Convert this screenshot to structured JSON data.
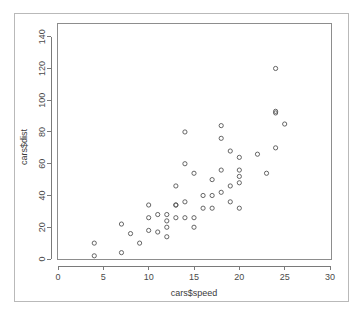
{
  "figure": {
    "background_color": "#ffffff",
    "frame_color": "#b9b9b9",
    "axis_color": "#7a7a7a",
    "point_color": "#555555"
  },
  "chart_data": {
    "type": "scatter",
    "title": "",
    "xlabel": "cars$speed",
    "ylabel": "cars$dist",
    "xlim": [
      0,
      30
    ],
    "ylim": [
      0,
      148
    ],
    "xticks": [
      0,
      5,
      10,
      15,
      20,
      25,
      30
    ],
    "yticks": [
      0,
      20,
      40,
      60,
      80,
      100,
      120,
      140
    ],
    "xticklabels": [
      "0",
      "5",
      "10",
      "15",
      "20",
      "25",
      "30"
    ],
    "yticklabels": [
      "0",
      "20",
      "40",
      "60",
      "80",
      "100",
      "120",
      "140"
    ],
    "grid": false,
    "legend": null,
    "marker": "open-circle",
    "n_points": 50,
    "x": [
      4,
      4,
      7,
      7,
      8,
      9,
      10,
      10,
      10,
      11,
      11,
      12,
      12,
      12,
      12,
      13,
      13,
      13,
      13,
      14,
      14,
      14,
      14,
      15,
      15,
      15,
      16,
      16,
      17,
      17,
      17,
      18,
      18,
      18,
      18,
      19,
      19,
      19,
      20,
      20,
      20,
      20,
      20,
      22,
      23,
      24,
      24,
      24,
      24,
      25
    ],
    "y": [
      2,
      10,
      4,
      22,
      16,
      10,
      18,
      26,
      34,
      17,
      28,
      14,
      20,
      24,
      28,
      26,
      34,
      34,
      46,
      26,
      36,
      60,
      80,
      20,
      26,
      54,
      32,
      40,
      32,
      40,
      50,
      42,
      56,
      76,
      84,
      36,
      46,
      68,
      32,
      48,
      52,
      56,
      64,
      66,
      54,
      70,
      92,
      93,
      120,
      85
    ]
  }
}
